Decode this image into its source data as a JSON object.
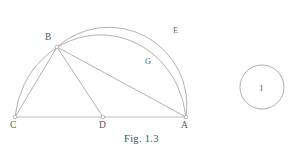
{
  "figure": {
    "caption": "Fig. 1.3",
    "stroke_color": "#9a9a9a",
    "baseline_color": "#a8a8a8",
    "label_color": "#585858",
    "background": "#ffffff",
    "points": [
      {
        "id": "C",
        "label": "C",
        "x": 15,
        "y": 117,
        "label_x": 10,
        "label_y": 121
      },
      {
        "id": "D",
        "label": "D",
        "x": 103,
        "y": 117,
        "label_x": 99,
        "label_y": 121
      },
      {
        "id": "A",
        "label": "A",
        "x": 186,
        "y": 117,
        "label_x": 181,
        "label_y": 121
      },
      {
        "id": "B",
        "label": "B",
        "x": 57,
        "y": 47,
        "label_x": 45,
        "label_y": 33
      }
    ],
    "region_labels": [
      {
        "id": "E",
        "label": "E",
        "x": 173,
        "y": 26
      },
      {
        "id": "G",
        "label": "G",
        "x": 145,
        "y": 57
      },
      {
        "id": "I",
        "label": "I",
        "x": 260,
        "y": 84
      }
    ],
    "segments": [
      {
        "id": "CA",
        "from": "C",
        "to": "A"
      },
      {
        "id": "CB",
        "from": "C",
        "to": "B"
      },
      {
        "id": "BD",
        "from": "B",
        "to": "D"
      },
      {
        "id": "BA",
        "from": "B",
        "to": "A"
      }
    ],
    "arcs": [
      {
        "id": "outer-arc-CBEA",
        "from": "C",
        "to": "A",
        "through": "E"
      },
      {
        "id": "inner-arc-BGA",
        "from": "B",
        "to": "A",
        "through": "G"
      }
    ],
    "circle": {
      "id": "circle-I",
      "label": "I",
      "cx": 262,
      "cy": 87,
      "r": 22
    }
  }
}
